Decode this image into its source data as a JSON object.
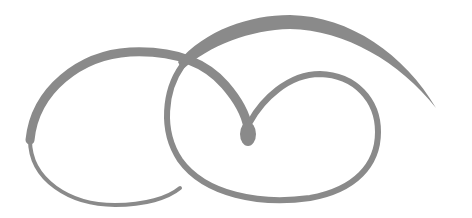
{
  "image": {
    "description": "decorative flourish ornament",
    "colors": {
      "background": "#ffffff",
      "ink": "#8a8a8a"
    }
  }
}
